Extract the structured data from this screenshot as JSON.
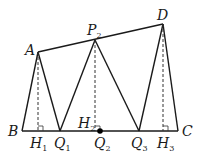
{
  "diagram": {
    "type": "geometry",
    "points": {
      "A": {
        "label": "A",
        "x": 38,
        "y": 52
      },
      "P2": {
        "label": "P",
        "sub": "2",
        "x": 95,
        "y": 40
      },
      "D": {
        "label": "D",
        "x": 163,
        "y": 24
      },
      "B": {
        "label": "B",
        "x": 22,
        "y": 131
      },
      "C": {
        "label": "C",
        "x": 178,
        "y": 131
      },
      "H1": {
        "label": "H",
        "sub": "1",
        "x": 38,
        "y": 131
      },
      "Q1": {
        "label": "Q",
        "sub": "1",
        "x": 60,
        "y": 131
      },
      "H2": {
        "label": "H",
        "sub": "2",
        "x": 96,
        "y": 131
      },
      "Q2": {
        "label": "Q",
        "sub": "2",
        "x": 100,
        "y": 131
      },
      "Q3": {
        "label": "Q",
        "sub": "3",
        "x": 139,
        "y": 131
      },
      "H3": {
        "label": "H",
        "sub": "3",
        "x": 163,
        "y": 131
      }
    },
    "segments": [
      [
        "A",
        "P2"
      ],
      [
        "P2",
        "D"
      ],
      [
        "B",
        "C"
      ],
      [
        "A",
        "B"
      ],
      [
        "A",
        "Q1"
      ],
      [
        "P2",
        "Q1"
      ],
      [
        "P2",
        "Q3"
      ],
      [
        "D",
        "Q3"
      ],
      [
        "D",
        "C"
      ]
    ],
    "dashed": [
      [
        "A",
        "H1"
      ],
      [
        "P2",
        "H2"
      ],
      [
        "D",
        "H3"
      ]
    ],
    "right_angles": [
      "H1",
      "H2",
      "H3"
    ],
    "marked_point": "Q2"
  }
}
